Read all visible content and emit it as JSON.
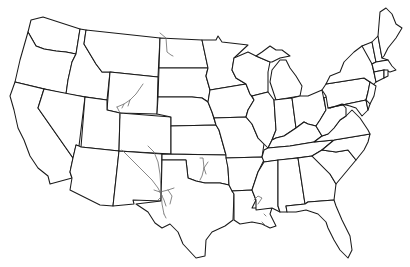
{
  "map": {
    "title": "",
    "subject": "Contiguous United States outline map",
    "style": "blank state-border outline",
    "colors": {
      "background": "#ffffff",
      "state_fill": "#ffffff",
      "border_stroke": "#1a1a1a",
      "feature_stroke": "#6a6a6a"
    },
    "states": [
      {
        "id": "WA",
        "name": "Washington"
      },
      {
        "id": "OR",
        "name": "Oregon"
      },
      {
        "id": "CA",
        "name": "California"
      },
      {
        "id": "ID",
        "name": "Idaho"
      },
      {
        "id": "NV",
        "name": "Nevada"
      },
      {
        "id": "MT",
        "name": "Montana"
      },
      {
        "id": "WY",
        "name": "Wyoming"
      },
      {
        "id": "UT",
        "name": "Utah"
      },
      {
        "id": "AZ",
        "name": "Arizona"
      },
      {
        "id": "CO",
        "name": "Colorado"
      },
      {
        "id": "NM",
        "name": "New Mexico"
      },
      {
        "id": "ND",
        "name": "North Dakota"
      },
      {
        "id": "SD",
        "name": "South Dakota"
      },
      {
        "id": "NE",
        "name": "Nebraska"
      },
      {
        "id": "KS",
        "name": "Kansas"
      },
      {
        "id": "OK",
        "name": "Oklahoma"
      },
      {
        "id": "TX",
        "name": "Texas"
      },
      {
        "id": "MN",
        "name": "Minnesota"
      },
      {
        "id": "IA",
        "name": "Iowa"
      },
      {
        "id": "MO",
        "name": "Missouri"
      },
      {
        "id": "AR",
        "name": "Arkansas"
      },
      {
        "id": "LA",
        "name": "Louisiana"
      },
      {
        "id": "WI",
        "name": "Wisconsin"
      },
      {
        "id": "IL",
        "name": "Illinois"
      },
      {
        "id": "MI",
        "name": "Michigan"
      },
      {
        "id": "IN",
        "name": "Indiana"
      },
      {
        "id": "OH",
        "name": "Ohio"
      },
      {
        "id": "KY",
        "name": "Kentucky"
      },
      {
        "id": "TN",
        "name": "Tennessee"
      },
      {
        "id": "MS",
        "name": "Mississippi"
      },
      {
        "id": "AL",
        "name": "Alabama"
      },
      {
        "id": "GA",
        "name": "Georgia"
      },
      {
        "id": "FL",
        "name": "Florida"
      },
      {
        "id": "SC",
        "name": "South Carolina"
      },
      {
        "id": "NC",
        "name": "North Carolina"
      },
      {
        "id": "VA",
        "name": "Virginia"
      },
      {
        "id": "WV",
        "name": "West Virginia"
      },
      {
        "id": "PA",
        "name": "Pennsylvania"
      },
      {
        "id": "NY",
        "name": "New York"
      },
      {
        "id": "VT",
        "name": "Vermont"
      },
      {
        "id": "NH",
        "name": "New Hampshire"
      },
      {
        "id": "ME",
        "name": "Maine"
      },
      {
        "id": "MA",
        "name": "Massachusetts"
      },
      {
        "id": "CT",
        "name": "Connecticut"
      },
      {
        "id": "RI",
        "name": "Rhode Island"
      },
      {
        "id": "NJ",
        "name": "New Jersey"
      },
      {
        "id": "DE",
        "name": "Delaware"
      },
      {
        "id": "MD",
        "name": "Maryland"
      }
    ],
    "overlay_features": [
      {
        "id": "wyoming-lines",
        "region": "Wyoming",
        "description": "gray linear features"
      },
      {
        "id": "north-dakota-line",
        "region": "North Dakota",
        "description": "gray linear feature"
      },
      {
        "id": "nm-tx-lines",
        "region": "New Mexico / West Texas",
        "description": "gray linear features network"
      },
      {
        "id": "oklahoma-lines",
        "region": "Oklahoma",
        "description": "gray linear features"
      },
      {
        "id": "louisiana-lines",
        "region": "Louisiana",
        "description": "gray linear features"
      }
    ]
  }
}
